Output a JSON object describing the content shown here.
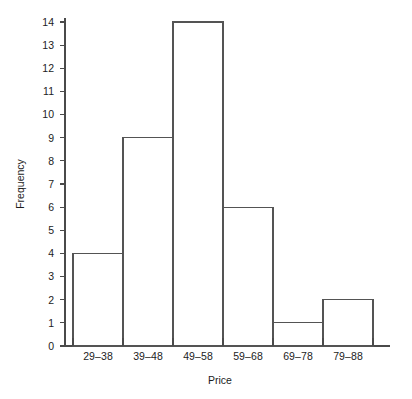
{
  "chart_data": {
    "type": "bar",
    "title": "",
    "subtitle": "",
    "xlabel": "Price",
    "ylabel": "Frequency",
    "categories": [
      "29–38",
      "39–48",
      "49–58",
      "59–68",
      "69–78",
      "79–88"
    ],
    "values": [
      4,
      9,
      14,
      6,
      1,
      2
    ],
    "ylim": [
      0,
      14
    ],
    "y_ticks": [
      0,
      1,
      2,
      3,
      4,
      5,
      6,
      7,
      8,
      9,
      10,
      11,
      12,
      13,
      14
    ],
    "y_tick_labels": [
      "0",
      "1",
      "2",
      "3",
      "4",
      "5",
      "6",
      "7",
      "8",
      "9",
      "10",
      "11",
      "12",
      "13",
      "14"
    ],
    "grid": false,
    "legend": null,
    "legend_position": "none",
    "bar_style": "outline",
    "bar_fill": "#ffffff",
    "bar_stroke": "#545454",
    "axis_color": "#4a4a4a",
    "text_color": "#1c1c1c",
    "background": "#ffffff",
    "annotations": []
  }
}
